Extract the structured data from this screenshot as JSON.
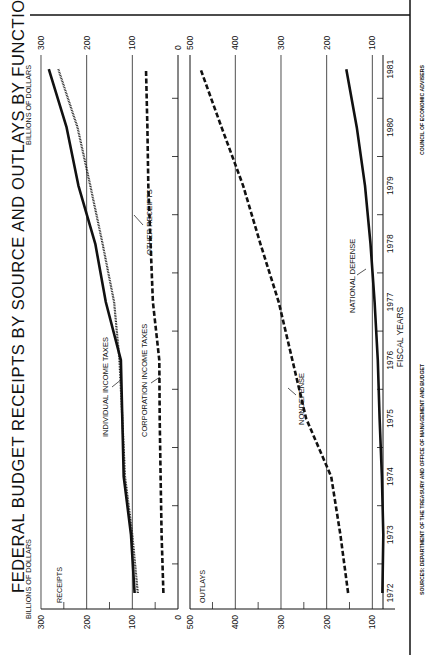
{
  "page": {
    "title": "FEDERAL BUDGET RECEIPTS BY SOURCE AND OUTLAYS BY FUNCTION",
    "units_left": "BILLIONS OF DOLLARS",
    "units_right": "BILLIONS OF DOLLARS",
    "x_axis_title": "FISCAL YEARS",
    "source": "SOURCES: DEPARTMENT OF THE TREASURY AND OFFICE OF MANAGEMENT AND BUDGET",
    "credit": "COUNCIL OF ECONOMIC ADVISERS",
    "panel_receipts_label": "RECEIPTS",
    "panel_outlays_label": "OUTLAYS",
    "receipts_ticks": [
      "300",
      "200",
      "100",
      "0"
    ],
    "outlays_ticks": [
      "500",
      "400",
      "300",
      "200",
      "100"
    ],
    "year_ticks": [
      "1972",
      "1973",
      "1974",
      "1975",
      "1976",
      "1977",
      "1978",
      "1979",
      "1980",
      "1981"
    ],
    "annotations": {
      "individual": "INDIVIDUAL INCOME TAXES",
      "other": "OTHER RECEIPTS",
      "corporation": "CORPORATION INCOME TAXES",
      "nondefense": "NONDEFENSE",
      "defense": "NATIONAL DEFENSE"
    }
  },
  "chart_data": [
    {
      "type": "line",
      "title": "Receipts",
      "xlabel": "FISCAL YEARS",
      "ylabel": "BILLIONS OF DOLLARS",
      "ylim": [
        0,
        300
      ],
      "grid": true,
      "x": [
        1972,
        1973,
        1974,
        1975,
        1976,
        1977,
        1978,
        1979,
        1980,
        1981
      ],
      "series": [
        {
          "name": "INDIVIDUAL INCOME TAXES",
          "style": "solid",
          "values": [
            95,
            103,
            119,
            122,
            125,
            158,
            181,
            218,
            244,
            283
          ]
        },
        {
          "name": "OTHER RECEIPTS",
          "style": "dotted",
          "values": [
            88,
            100,
            116,
            122,
            128,
            140,
            165,
            192,
            220,
            262
          ]
        },
        {
          "name": "CORPORATION INCOME TAXES",
          "style": "dashed",
          "values": [
            32,
            36,
            38,
            40,
            41,
            55,
            60,
            65,
            67,
            70
          ]
        }
      ]
    },
    {
      "type": "line",
      "title": "Outlays",
      "xlabel": "FISCAL YEARS",
      "ylabel": "BILLIONS OF DOLLARS",
      "ylim": [
        50,
        500
      ],
      "grid": true,
      "x": [
        1972,
        1973,
        1974,
        1975,
        1976,
        1977,
        1978,
        1979,
        1980,
        1981
      ],
      "series": [
        {
          "name": "NONDEFENSE",
          "style": "dashed",
          "values": [
            153,
            170,
            190,
            245,
            275,
            305,
            345,
            383,
            430,
            476
          ]
        },
        {
          "name": "NATIONAL DEFENSE",
          "style": "solid",
          "values": [
            78,
            76,
            79,
            84,
            88,
            95,
            104,
            116,
            134,
            157
          ]
        }
      ]
    }
  ]
}
